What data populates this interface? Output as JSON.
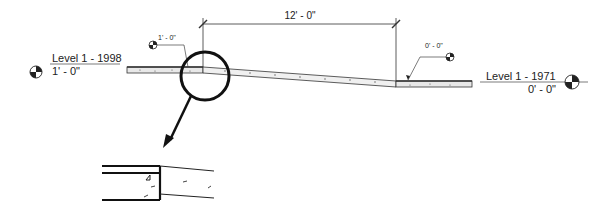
{
  "levels": {
    "left": {
      "name": "Level 1 - 1998",
      "elevation": "1' - 0\""
    },
    "right": {
      "name": "Level 1 - 1971",
      "elevation": "0' - 0\""
    }
  },
  "spot_elevations": {
    "left": "1' - 0\"",
    "right": "0' - 0\""
  },
  "dimension": {
    "value": "12' - 0\""
  },
  "colors": {
    "line": "#222222",
    "slab_fill": "#e8e8e8",
    "background": "#ffffff"
  }
}
